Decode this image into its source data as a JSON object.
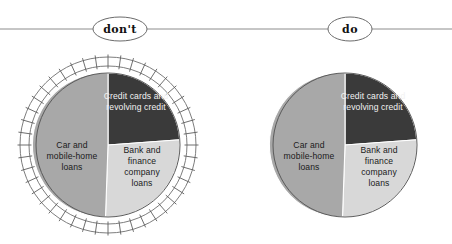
{
  "header": {
    "divider": "horizontal-rule",
    "labels": [
      {
        "id": "dont",
        "text": "don't",
        "cx": 120,
        "cy": 29,
        "rx": 27,
        "ry": 12
      },
      {
        "id": "do",
        "text": "do",
        "cx": 350,
        "cy": 29,
        "rx": 22,
        "ry": 12
      }
    ]
  },
  "colors": {
    "dark": "#3a3a3a",
    "medium": "#a8a8a8",
    "light": "#d8d8d8",
    "outline": "#5a5a5a",
    "rule": "#8c8c8c",
    "label_dark_text": "#f2f2f2",
    "label_light_text": "#1b1b1b",
    "background": "#ffffff"
  },
  "chart_data": {
    "type": "pie",
    "title": "",
    "xlabel": "",
    "ylabel": "",
    "legend_position": "inside-slices",
    "grid": false,
    "categories": [
      "Credit cards and revolving credit",
      "Bank and finance company loans",
      "Car and mobile-home loans"
    ],
    "values": [
      26,
      24,
      50
    ],
    "units": "percent",
    "slice_colors": [
      "#3a3a3a",
      "#d8d8d8",
      "#a8a8a8"
    ],
    "start_angle_deg": 0,
    "direction": "clockwise",
    "charts": [
      {
        "id": "dont-pie",
        "variant": "don't",
        "decoration": "hatched-tick-ring",
        "center": {
          "x": 108,
          "y": 145
        },
        "radius": 72
      },
      {
        "id": "do-pie",
        "variant": "do",
        "decoration": "none",
        "center": {
          "x": 345,
          "y": 145
        },
        "radius": 72
      }
    ]
  },
  "slices": {
    "credit_cards": {
      "label_line1": "Credit cards and",
      "label_line2": "revolving credit",
      "color": "#3a3a3a",
      "text_on": "dark",
      "share": 26
    },
    "bank_finance": {
      "label_line1": "Bank and",
      "label_line2": "finance",
      "label_line3": "company",
      "label_line4": "loans",
      "color": "#d8d8d8",
      "text_on": "light",
      "share": 24
    },
    "car_mobile": {
      "label_line1": "Car and",
      "label_line2": "mobile-home",
      "label_line3": "loans",
      "color": "#a8a8a8",
      "text_on": "light",
      "share": 50
    }
  }
}
